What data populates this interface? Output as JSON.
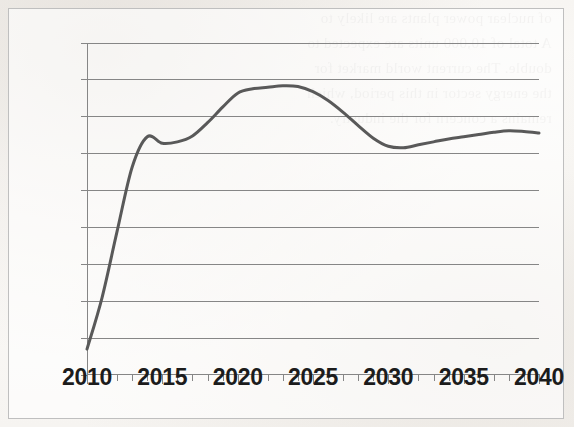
{
  "figure": {
    "background_color": "#fbfaf8",
    "frame_color": "#bfbfbf",
    "ghost_text": "  of nuclear power plants are likely to\n  A total of 10,000 units are expected to\n  double. The current world market for\n  the energy sector in this period, which\n  remains a concern for the industry.\n"
  },
  "chart_data": {
    "type": "line",
    "title": "",
    "subtitle": "",
    "xlabel": "",
    "ylabel": "",
    "xlim": [
      2010,
      2040
    ],
    "ylim": [
      0,
      45
    ],
    "ytick_step": 5,
    "xtick_step": 5,
    "x_minor_tick_step": 1,
    "grid": true,
    "grid_axis": "y",
    "legend": false,
    "legend_position": "none",
    "line_color": "#595959",
    "line_width": 3,
    "ytick_labels": [
      "0",
      "5",
      "10",
      "15",
      "20",
      "25",
      "30",
      "35",
      "40",
      "45"
    ],
    "ytick_values": [
      0,
      5,
      10,
      15,
      20,
      25,
      30,
      35,
      40,
      45
    ],
    "xtick_labels": [
      "2010",
      "2015",
      "2020",
      "2025",
      "2030",
      "2035",
      "2040"
    ],
    "xtick_values": [
      2010,
      2015,
      2020,
      2025,
      2030,
      2035,
      2040
    ],
    "series": [
      {
        "name": "series-1",
        "color": "#595959",
        "x": [
          2010,
          2011,
          2012,
          2013,
          2014,
          2015,
          2016,
          2017,
          2018,
          2019,
          2020,
          2021,
          2022,
          2023,
          2024,
          2025,
          2026,
          2027,
          2028,
          2029,
          2030,
          2031,
          2032,
          2033,
          2034,
          2035,
          2036,
          2037,
          2038,
          2039,
          2040
        ],
        "values": [
          3.5,
          10.5,
          19.5,
          28.2,
          32.3,
          31.4,
          31.6,
          32.4,
          34.2,
          36.3,
          38.2,
          38.8,
          39.0,
          39.2,
          39.1,
          38.4,
          37.2,
          35.6,
          33.8,
          32.1,
          31.0,
          30.8,
          31.2,
          31.6,
          32.0,
          32.3,
          32.6,
          32.9,
          33.1,
          33.0,
          32.8
        ]
      }
    ]
  }
}
